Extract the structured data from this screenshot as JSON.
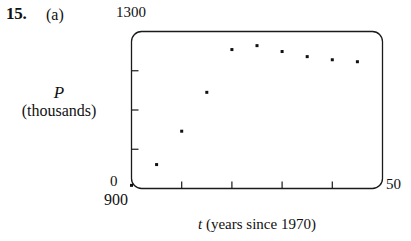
{
  "problem": {
    "number": "15.",
    "part": "(a)"
  },
  "axes": {
    "y_axis_label_variable": "P",
    "y_axis_label_units": "(thousands)",
    "y_max_label": "1300",
    "y_zero_label": "0",
    "y_min_label": "900",
    "x_max_label": "50",
    "x_axis_label_variable": "t",
    "x_axis_label_rest": " (years since 1970)"
  },
  "chart_data": {
    "type": "scatter",
    "title": "",
    "xlabel": "t (years since 1970)",
    "ylabel": "P (thousands)",
    "xlim": [
      0,
      50
    ],
    "ylim": [
      900,
      1300
    ],
    "grid": false,
    "legend": null,
    "x_tick_labels": [
      "0",
      "50"
    ],
    "y_tick_labels": [
      "900",
      "1300"
    ],
    "x_unlabeled_ticks": [
      10,
      20,
      30,
      40
    ],
    "y_unlabeled_ticks": [
      1000,
      1100,
      1200
    ],
    "x": [
      0,
      5,
      10,
      15,
      20,
      25,
      30,
      35,
      40,
      45
    ],
    "y": [
      908,
      961,
      1046,
      1145,
      1254,
      1264,
      1249,
      1236,
      1228,
      1223
    ],
    "point_style": {
      "marker": "square-dot",
      "color": "#111111",
      "size_px": 3
    }
  },
  "plot_box": {
    "border_color": "#1a1a1a",
    "corner_radius_px": 10,
    "background": "#ffffff"
  }
}
